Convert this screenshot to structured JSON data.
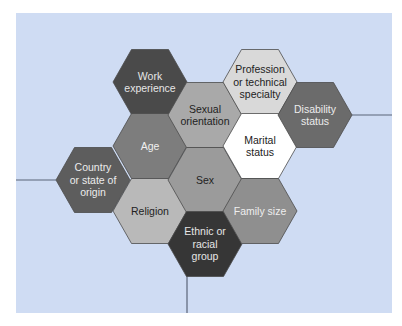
{
  "diagram": {
    "background": "#cfdcf3",
    "line_color": "#5a6478",
    "hexagons": [
      {
        "id": "work-experience",
        "lines": [
          "Work",
          "experience"
        ],
        "cx": 150,
        "cy": 82,
        "fill": "#4a4a4a",
        "text": "#e6e6e6"
      },
      {
        "id": "age",
        "lines": [
          "Age"
        ],
        "cx": 150,
        "cy": 146,
        "fill": "#7d7d7d",
        "text": "#f0f0f0"
      },
      {
        "id": "religion",
        "lines": [
          "Religion"
        ],
        "cx": 150,
        "cy": 211,
        "fill": "#b9b9b9",
        "text": "#222222"
      },
      {
        "id": "country-or-state-of-origin",
        "lines": [
          "Country",
          "or state of",
          "origin"
        ],
        "cx": 93,
        "cy": 180,
        "fill": "#5d5d5d",
        "text": "#ececec"
      },
      {
        "id": "sexual-orientation",
        "lines": [
          "Sexual",
          "orientation"
        ],
        "cx": 205,
        "cy": 115,
        "fill": "#a9a9a9",
        "text": "#222222"
      },
      {
        "id": "sex",
        "lines": [
          "Sex"
        ],
        "cx": 205,
        "cy": 180,
        "fill": "#9b9b9b",
        "text": "#222222"
      },
      {
        "id": "ethnic-or-racial-group",
        "lines": [
          "Ethnic or",
          "racial",
          "group"
        ],
        "cx": 205,
        "cy": 244,
        "fill": "#363636",
        "text": "#e6e6e6"
      },
      {
        "id": "profession-or-technical-specialty",
        "lines": [
          "Profession",
          "or technical",
          "specialty"
        ],
        "cx": 260,
        "cy": 82,
        "fill": "#d9d9d9",
        "text": "#222222"
      },
      {
        "id": "marital-status",
        "lines": [
          "Marital",
          "status"
        ],
        "cx": 260,
        "cy": 146,
        "fill": "#ffffff",
        "text": "#222222"
      },
      {
        "id": "family-size",
        "lines": [
          "Family size"
        ],
        "cx": 260,
        "cy": 211,
        "fill": "#8f8f8f",
        "text": "#eeeeee"
      },
      {
        "id": "disability-status",
        "lines": [
          "Disability",
          "status"
        ],
        "cx": 315,
        "cy": 115,
        "fill": "#6b6b6b",
        "text": "#ececec"
      }
    ],
    "connector_lines": [
      {
        "id": "left-line",
        "x1": 16,
        "y1": 180,
        "x2": 56,
        "y2": 180
      },
      {
        "id": "right-line",
        "x1": 352,
        "y1": 115,
        "x2": 392,
        "y2": 115
      },
      {
        "id": "bottom-line",
        "x1": 187,
        "y1": 276,
        "x2": 187,
        "y2": 313
      }
    ]
  }
}
